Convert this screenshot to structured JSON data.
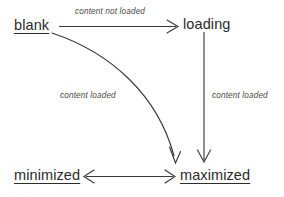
{
  "diagram": {
    "type": "state-transition-diagram",
    "background_color": "#ffffff",
    "line_color": "#3a3a3a",
    "text_color": "#2b2b2b",
    "width": 284,
    "height": 197,
    "states": [
      {
        "id": "blank",
        "label": "blank",
        "underlined": true,
        "x": 14,
        "y": 18
      },
      {
        "id": "loading",
        "label": "loading",
        "underlined": false,
        "x": 183,
        "y": 17
      },
      {
        "id": "minimized",
        "label": "minimized",
        "underlined": true,
        "x": 14,
        "y": 168
      },
      {
        "id": "maximized",
        "label": "maximized",
        "underlined": true,
        "x": 180,
        "y": 168
      }
    ],
    "transitions": [
      {
        "id": "blank-to-loading",
        "from": "blank",
        "to": "loading",
        "label": "content not loaded",
        "shape": "straight",
        "direction": "right",
        "label_x": 75,
        "label_y": 8
      },
      {
        "id": "blank-to-maximized",
        "from": "blank",
        "to": "maximized",
        "label": "content loaded",
        "shape": "curved",
        "direction": "down-right",
        "label_x": 60,
        "label_y": 92
      },
      {
        "id": "loading-to-maximized",
        "from": "loading",
        "to": "maximized",
        "label": "content loaded",
        "shape": "straight",
        "direction": "down",
        "label_x": 212,
        "label_y": 92
      },
      {
        "id": "minimized-maximized",
        "from": "minimized",
        "to": "maximized",
        "label": "",
        "shape": "straight",
        "direction": "bidirectional",
        "label_x": 0,
        "label_y": 0
      }
    ]
  }
}
